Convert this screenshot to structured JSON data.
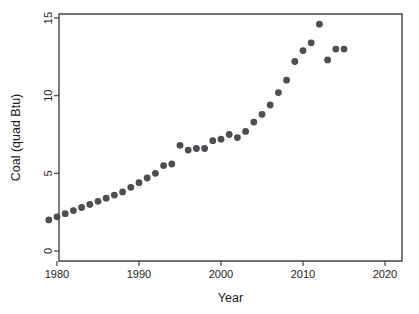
{
  "chart_data": {
    "type": "scatter",
    "title": "",
    "xlabel": "Year",
    "ylabel": "Coal (quad Btu)",
    "xlim": [
      1977,
      2021
    ],
    "ylim": [
      0,
      15
    ],
    "xticks": [
      1980,
      1990,
      2000,
      2010,
      2020
    ],
    "xtick_labels": [
      "1980",
      "1990",
      "2000",
      "2010",
      "2020"
    ],
    "yticks": [
      0,
      5,
      10,
      15
    ],
    "ytick_labels": [
      "0",
      "5",
      "10",
      "15"
    ],
    "grid": false,
    "legend": null,
    "marker": "filled-circle",
    "marker_color": "#4d4d52",
    "marker_size_px": 3.4,
    "x": [
      1979,
      1980,
      1981,
      1982,
      1983,
      1984,
      1985,
      1986,
      1987,
      1988,
      1989,
      1990,
      1991,
      1992,
      1993,
      1994,
      1995,
      1996,
      1997,
      1998,
      1999,
      2000,
      2001,
      2002,
      2003,
      2004,
      2005,
      2006,
      2007,
      2008,
      2009,
      2010,
      2011,
      2012,
      2013,
      2014,
      2015
    ],
    "y": [
      2.0,
      2.2,
      2.4,
      2.6,
      2.8,
      3.0,
      3.2,
      3.4,
      3.6,
      3.8,
      4.1,
      4.4,
      4.7,
      5.0,
      5.5,
      5.6,
      6.8,
      6.5,
      6.6,
      6.6,
      7.1,
      7.2,
      7.5,
      7.3,
      7.7,
      8.3,
      8.8,
      9.4,
      10.2,
      11.0,
      12.2,
      12.9,
      13.4,
      14.6,
      12.3,
      13.0,
      13.0
    ],
    "series": [
      {
        "name": "Coal consumption",
        "points": [
          {
            "year": 1979,
            "value": 2.0
          },
          {
            "year": 1980,
            "value": 2.2
          },
          {
            "year": 1981,
            "value": 2.4
          },
          {
            "year": 1982,
            "value": 2.6
          },
          {
            "year": 1983,
            "value": 2.8
          },
          {
            "year": 1984,
            "value": 3.0
          },
          {
            "year": 1985,
            "value": 3.2
          },
          {
            "year": 1986,
            "value": 3.4
          },
          {
            "year": 1987,
            "value": 3.6
          },
          {
            "year": 1988,
            "value": 3.8
          },
          {
            "year": 1989,
            "value": 4.1
          },
          {
            "year": 1990,
            "value": 4.4
          },
          {
            "year": 1991,
            "value": 4.7
          },
          {
            "year": 1992,
            "value": 5.0
          },
          {
            "year": 1993,
            "value": 5.5
          },
          {
            "year": 1994,
            "value": 5.6
          },
          {
            "year": 1995,
            "value": 6.8
          },
          {
            "year": 1996,
            "value": 6.5
          },
          {
            "year": 1997,
            "value": 6.6
          },
          {
            "year": 1998,
            "value": 6.6
          },
          {
            "year": 1999,
            "value": 7.1
          },
          {
            "year": 2000,
            "value": 7.2
          },
          {
            "year": 2001,
            "value": 7.5
          },
          {
            "year": 2002,
            "value": 7.3
          },
          {
            "year": 2003,
            "value": 7.7
          },
          {
            "year": 2004,
            "value": 8.3
          },
          {
            "year": 2005,
            "value": 8.8
          },
          {
            "year": 2006,
            "value": 9.4
          },
          {
            "year": 2007,
            "value": 10.2
          },
          {
            "year": 2008,
            "value": 11.0
          },
          {
            "year": 2009,
            "value": 12.2
          },
          {
            "year": 2010,
            "value": 12.9
          },
          {
            "year": 2011,
            "value": 13.4
          },
          {
            "year": 2012,
            "value": 14.6
          },
          {
            "year": 2013,
            "value": 12.3
          },
          {
            "year": 2014,
            "value": 13.0
          },
          {
            "year": 2015,
            "value": 13.0
          }
        ]
      }
    ]
  },
  "colors": {
    "marker": "#4d4d52",
    "axis": "#444444",
    "text": "#1a1a1a",
    "background": "#ffffff"
  }
}
